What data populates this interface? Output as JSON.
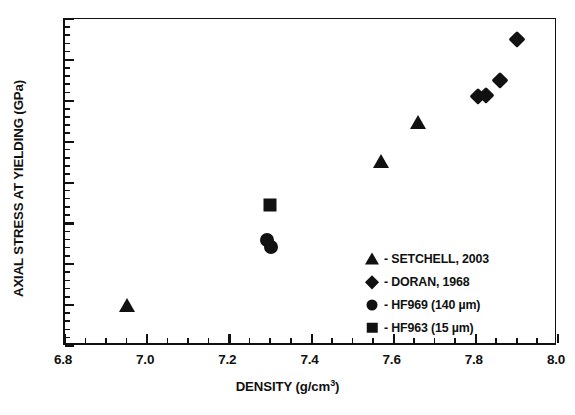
{
  "chart_data": {
    "type": "scatter",
    "title": "",
    "xlabel": "DENSITY (g/cm",
    "xlabel_sup": "3",
    "xlabel_tail": ")",
    "xlabel_full": "DENSITY (g/cm3)",
    "ylabel": "AXIAL STRESS AT YIELDING (GPa)",
    "xlim": [
      6.8,
      8.0
    ],
    "ylim": [
      1.0,
      5.0
    ],
    "xticks": [
      "6.8",
      "7.0",
      "7.2",
      "7.4",
      "7.6",
      "7.8",
      "8.0"
    ],
    "xtick_values": [
      6.8,
      7.0,
      7.2,
      7.4,
      7.6,
      7.8,
      8.0
    ],
    "xminor_step": 0.05,
    "yticks": [
      "1.0",
      "1.5",
      "2.0",
      "2.5",
      "3.0",
      "3.5",
      "4.0",
      "4.5",
      "5.0"
    ],
    "ytick_values": [
      1.0,
      1.5,
      2.0,
      2.5,
      3.0,
      3.5,
      4.0,
      4.5,
      5.0
    ],
    "yminor_step": 0.1,
    "grid": false,
    "legend_position": "lower-right-inside",
    "marker_color": "#111111",
    "series": [
      {
        "name": "SETCHELL, 2003",
        "legend_label": "- SETCHELL, 2003",
        "marker": "triangle",
        "points": [
          {
            "x": 6.95,
            "y": 1.49
          },
          {
            "x": 7.57,
            "y": 3.25
          },
          {
            "x": 7.66,
            "y": 3.73
          }
        ]
      },
      {
        "name": "DORAN, 1968",
        "legend_label": "- DORAN, 1968",
        "marker": "diamond",
        "points": [
          {
            "x": 7.805,
            "y": 4.06
          },
          {
            "x": 7.825,
            "y": 4.07
          },
          {
            "x": 7.86,
            "y": 4.25
          },
          {
            "x": 7.9,
            "y": 4.75
          }
        ]
      },
      {
        "name": "HF969 (140 µm)",
        "legend_label": "- HF969 (140 µm)",
        "marker": "circle",
        "points": [
          {
            "x": 7.292,
            "y": 2.3
          },
          {
            "x": 7.302,
            "y": 2.21
          }
        ]
      },
      {
        "name": "HF963 (15 µm)",
        "legend_label": "- HF963 (15 µm)",
        "marker": "square",
        "points": [
          {
            "x": 7.3,
            "y": 2.73
          }
        ]
      }
    ]
  }
}
